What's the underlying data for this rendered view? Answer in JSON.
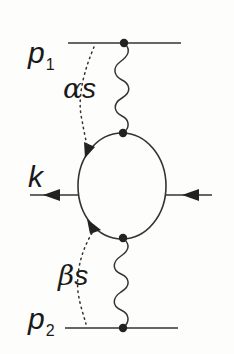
{
  "diagram": {
    "type": "feynman-diagram",
    "colors": {
      "line": "#333333",
      "vertex": "#222222",
      "text": "#1a1a1a",
      "background": "#fdfdfb"
    },
    "labels": {
      "p1": {
        "main": "p",
        "sub": "1"
      },
      "p2": {
        "main": "p",
        "sub": "2"
      },
      "alpha_s": {
        "greek": "α",
        "var": "s"
      },
      "beta_s": {
        "greek": "β",
        "var": "s"
      },
      "k": "k"
    },
    "lines": [
      {
        "name": "incoming-p1-line",
        "kind": "straight",
        "from": [
          68,
          43
        ],
        "to": [
          181,
          43
        ]
      },
      {
        "name": "incoming-p2-line",
        "kind": "straight",
        "from": [
          65,
          328
        ],
        "to": [
          178,
          328
        ]
      },
      {
        "name": "top-gluon-line",
        "kind": "wavy",
        "from": [
          124,
          43
        ],
        "to": [
          123,
          133
        ]
      },
      {
        "name": "bottom-gluon-line",
        "kind": "wavy",
        "from": [
          123,
          238
        ],
        "to": [
          123,
          328
        ]
      },
      {
        "name": "quark-loop",
        "kind": "ellipse",
        "center": [
          122,
          186
        ],
        "rx": 44,
        "ry": 53
      },
      {
        "name": "outgoing-k-line",
        "kind": "straight",
        "from": [
          78,
          195
        ],
        "to": [
          30,
          195
        ],
        "arrow": "left"
      },
      {
        "name": "incoming-right-line",
        "kind": "straight",
        "from": [
          212,
          195
        ],
        "to": [
          165,
          195
        ],
        "arrow": "left"
      },
      {
        "name": "alpha-s-momentum-flow",
        "kind": "dotted",
        "from": [
          93,
          47
        ],
        "to": [
          86,
          148
        ]
      },
      {
        "name": "beta-s-momentum-flow",
        "kind": "dotted",
        "from": [
          92,
          232
        ],
        "to": [
          86,
          324
        ]
      }
    ],
    "vertices": [
      {
        "name": "vertex-top-p1",
        "at": [
          124,
          43
        ]
      },
      {
        "name": "vertex-loop-top",
        "at": [
          123,
          133
        ]
      },
      {
        "name": "vertex-loop-bottom",
        "at": [
          123,
          238
        ]
      },
      {
        "name": "vertex-bottom-p2",
        "at": [
          123,
          328
        ]
      }
    ]
  }
}
